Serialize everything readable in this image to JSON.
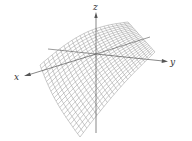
{
  "figure": {
    "type": "3d-surface-plot",
    "axes": {
      "x": {
        "label": "x"
      },
      "y": {
        "label": "y"
      },
      "z": {
        "label": "z"
      }
    },
    "colors": {
      "mesh": "#8a8a8a",
      "axis": "#555555",
      "background": "#ffffff"
    }
  }
}
